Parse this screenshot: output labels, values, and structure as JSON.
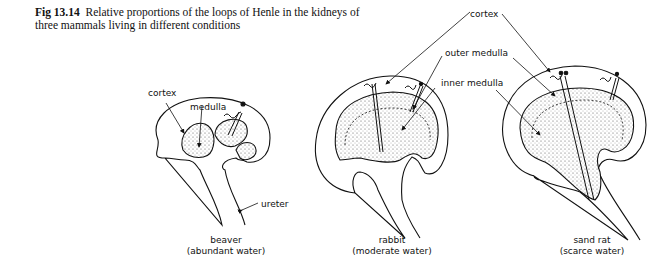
{
  "figure": {
    "number": "Fig 13.14",
    "caption_line1": "Relative proportions of the loops of Henle in the kidneys of",
    "caption_line2": "three mammals living in different conditions"
  },
  "labels": {
    "cortex_left": "cortex",
    "medulla_left": "medulla",
    "ureter": "ureter",
    "cortex_right": "cortex",
    "outer_medulla": "outer medulla",
    "inner_medulla": "inner medulla"
  },
  "kidneys": [
    {
      "animal": "beaver",
      "condition": "(abundant water)"
    },
    {
      "animal": "rabbit",
      "condition": "(moderate water)"
    },
    {
      "animal": "sand rat",
      "condition": "(scarce water)"
    }
  ],
  "colors": {
    "ink": "#111111",
    "stipple": "#c8c8c8",
    "background": "#ffffff"
  }
}
